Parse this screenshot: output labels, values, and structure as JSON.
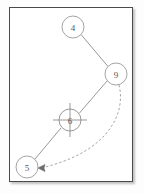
{
  "figure": {
    "title": "",
    "frame": {
      "border_color": "#4a4a4a",
      "background": "#ffffff",
      "shadow": true
    },
    "style": {
      "node_stroke": "#9a9a9a",
      "node_fill": "#ffffff",
      "label_color": "#555555",
      "solid_edge_color": "#8c8c8c",
      "dashed_edge_color": "#9a9a9a",
      "crosshair_color": "#8c8c8c"
    }
  },
  "graph": {
    "nodes": [
      {
        "id": "n4",
        "label": "4",
        "cx": 73,
        "cy": 27,
        "r": 11,
        "marker": "none"
      },
      {
        "id": "n9",
        "label": "9",
        "cx": 116,
        "cy": 74,
        "r": 11,
        "marker": "none"
      },
      {
        "id": "n6",
        "label": "6",
        "cx": 70,
        "cy": 120,
        "r": 11,
        "marker": "crosshair"
      },
      {
        "id": "n5",
        "label": "5",
        "cx": 27,
        "cy": 167,
        "r": 11,
        "marker": "none"
      }
    ],
    "edges": [
      {
        "id": "e-4-9",
        "from": "4",
        "to": "9",
        "style": "solid",
        "arrow": "none"
      },
      {
        "id": "e-9-6",
        "from": "9",
        "to": "6",
        "style": "solid",
        "arrow": "none"
      },
      {
        "id": "e-6-5",
        "from": "6",
        "to": "5",
        "style": "solid",
        "arrow": "none"
      },
      {
        "id": "e-9-5",
        "from": "9",
        "to": "5",
        "style": "dashed",
        "arrow": "to-target",
        "curved": true
      }
    ]
  }
}
